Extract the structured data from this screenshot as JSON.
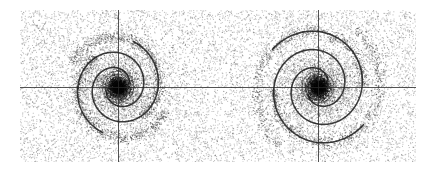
{
  "figure": {
    "background_color": "#ffffff",
    "ink_color": "#1a1a1a",
    "panels": [
      {
        "id": "left",
        "x": 20,
        "y": 10,
        "width": 196,
        "height": 152,
        "center": [
          118,
          87
        ],
        "spiral": {
          "arms": 2,
          "turns": 1.15,
          "inner_radius": 12,
          "outer_radius": 46,
          "rotation": 0.3
        }
      },
      {
        "id": "right",
        "x": 216,
        "y": 10,
        "width": 200,
        "height": 152,
        "center": [
          318,
          87
        ],
        "spiral": {
          "arms": 2,
          "turns": 1.3,
          "inner_radius": 12,
          "outer_radius": 58,
          "rotation": 0.6
        }
      }
    ]
  }
}
